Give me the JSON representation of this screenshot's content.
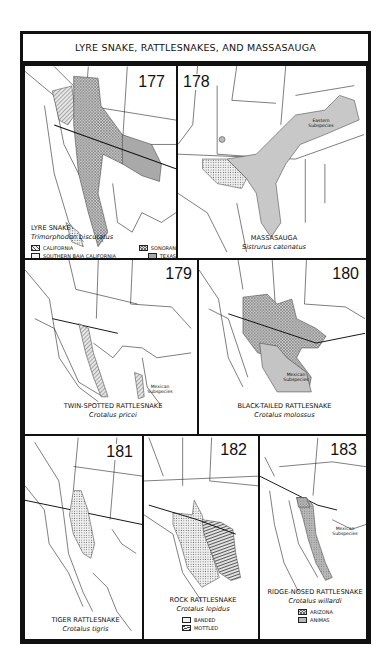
{
  "page": {
    "title": "LYRE SNAKE, RATTLESNAKES, AND MASSASAUGA"
  },
  "colors": {
    "border": "#111111",
    "range_fill_light": "#d8d8d8",
    "range_fill_dark": "#a9a9a9",
    "background": "#ffffff"
  },
  "maps": [
    {
      "number": "177",
      "common_name": "LYRE SNAKE",
      "scientific_name": "Trimorphodon biscutatus",
      "legend": [
        {
          "pattern": "diagonal-hatch",
          "label": "CALIFORNIA"
        },
        {
          "pattern": "light-dots",
          "label": "SOUTHERN BAJA CALIFORNIA"
        },
        {
          "pattern": "crosshatch",
          "label": "SONORAN"
        },
        {
          "pattern": "dark-gray",
          "label": "TEXAS"
        }
      ],
      "notes": []
    },
    {
      "number": "178",
      "common_name": "MASSASAUGA",
      "scientific_name": "Sistrurus catenatus",
      "legend": [],
      "notes": [
        "Eastern Subspecies"
      ]
    },
    {
      "number": "179",
      "common_name": "TWIN-SPOTTED RATTLESNAKE",
      "scientific_name": "Crotalus pricei",
      "legend": [],
      "notes": [
        "Mexican Subspecies"
      ]
    },
    {
      "number": "180",
      "common_name": "BLACK-TAILED RATTLESNAKE",
      "scientific_name": "Crotalus molossus",
      "legend": [],
      "notes": [
        "Mexican Subspecies"
      ]
    },
    {
      "number": "181",
      "common_name": "TIGER RATTLESNAKE",
      "scientific_name": "Crotalus tigris",
      "legend": [],
      "notes": []
    },
    {
      "number": "182",
      "common_name": "ROCK RATTLESNAKE",
      "scientific_name": "Crotalus lepidus",
      "legend": [
        {
          "pattern": "light-dots",
          "label": "BANDED"
        },
        {
          "pattern": "horizontal-hatch",
          "label": "MOTTLED"
        }
      ],
      "notes": []
    },
    {
      "number": "183",
      "common_name": "RIDGE-NOSED RATTLESNAKE",
      "scientific_name": "Crotalus willardi",
      "legend": [
        {
          "pattern": "crosshatch",
          "label": "ARIZONA"
        },
        {
          "pattern": "gray-dots",
          "label": "ANIMAS"
        }
      ],
      "notes": [
        "Mexican Subspecies"
      ]
    }
  ]
}
